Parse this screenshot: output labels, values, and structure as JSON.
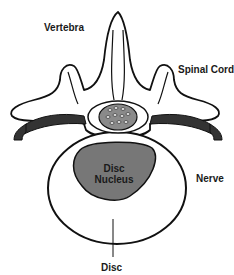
{
  "labels": {
    "vertebra": "Vertebra",
    "spinal_cord": "Spinal Cord",
    "nerve": "Nerve",
    "disc_nucleus_line1": "Disc",
    "disc_nucleus_line2": "Nucleus",
    "disc": "Disc"
  },
  "colors": {
    "outline": "#111111",
    "nucleus_fill": "#777777",
    "nerve_fill": "#333333",
    "spinal_cord_fill": "#8a8a8a",
    "background": "#ffffff"
  }
}
